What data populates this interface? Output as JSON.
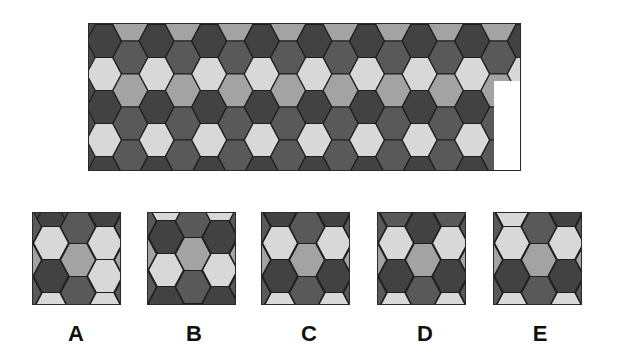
{
  "puzzle": {
    "question_mark": "?",
    "colors": {
      "dark": "#424242",
      "darkmed": "#595959",
      "medium": "#a3a3a3",
      "light": "#d8d8d8",
      "outline": "#1e1e1e",
      "background": "#4a4a4a"
    },
    "main_grid": {
      "hex_width": 35,
      "hex_height": 33,
      "col_pitch": 26.3,
      "even_col_x0": 15,
      "odd_col_x0": 41.3,
      "even_col_y": [
        17,
        50,
        83,
        116,
        149
      ],
      "odd_col_y": [
        0.5,
        33.5,
        66.5,
        99.5,
        132.5,
        165.5
      ],
      "even_col_pattern": [
        "dark",
        "light",
        "dark",
        "light",
        "dark"
      ],
      "odd_col_pattern": [
        "medium",
        "darkmed",
        "medium",
        "darkmed",
        "darkmed",
        "darkmed"
      ],
      "num_columns": 17
    },
    "options": [
      {
        "label": "A",
        "box_x": 32,
        "label_x": 56,
        "columns": [
          {
            "x": 18,
            "cells": [
              {
                "y": 13,
                "c": "dark"
              },
              {
                "y": 30,
                "c": "light"
              },
              {
                "y": 63,
                "c": "dark"
              },
              {
                "y": 96,
                "c": "light"
              }
            ]
          },
          {
            "x": 45,
            "cells": [
              {
                "y": 14,
                "c": "darkmed"
              },
              {
                "y": 47,
                "c": "medium"
              },
              {
                "y": 80,
                "c": "darkmed"
              }
            ]
          },
          {
            "x": 72,
            "cells": [
              {
                "y": -3,
                "c": "dark"
              },
              {
                "y": 30,
                "c": "light"
              },
              {
                "y": 63,
                "c": "light"
              },
              {
                "y": 96,
                "c": "light"
              }
            ]
          },
          {
            "x": -9,
            "cells": [
              {
                "y": 14,
                "c": "darkmed"
              },
              {
                "y": 47,
                "c": "medium"
              },
              {
                "y": 80,
                "c": "darkmed"
              }
            ]
          },
          {
            "x": 99,
            "cells": [
              {
                "y": 14,
                "c": "darkmed"
              },
              {
                "y": 47,
                "c": "medium"
              },
              {
                "y": 80,
                "c": "darkmed"
              }
            ]
          }
        ]
      },
      {
        "label": "B",
        "box_x": 147,
        "label_x": 174,
        "columns": [
          {
            "x": 18,
            "cells": [
              {
                "y": -7,
                "c": "light"
              },
              {
                "y": 24,
                "c": "dark"
              },
              {
                "y": 57,
                "c": "light"
              },
              {
                "y": 90,
                "c": "dark"
              }
            ]
          },
          {
            "x": 45,
            "cells": [
              {
                "y": 8,
                "c": "darkmed"
              },
              {
                "y": 41,
                "c": "medium"
              },
              {
                "y": 74,
                "c": "darkmed"
              }
            ]
          },
          {
            "x": 72,
            "cells": [
              {
                "y": -7,
                "c": "light"
              },
              {
                "y": 24,
                "c": "dark"
              },
              {
                "y": 57,
                "c": "light"
              },
              {
                "y": 90,
                "c": "dark"
              }
            ]
          },
          {
            "x": -9,
            "cells": [
              {
                "y": 8,
                "c": "darkmed"
              },
              {
                "y": 41,
                "c": "medium"
              },
              {
                "y": 74,
                "c": "darkmed"
              }
            ]
          },
          {
            "x": 99,
            "cells": [
              {
                "y": 8,
                "c": "darkmed"
              },
              {
                "y": 41,
                "c": "medium"
              },
              {
                "y": 74,
                "c": "darkmed"
              }
            ]
          }
        ]
      },
      {
        "label": "C",
        "box_x": 261,
        "label_x": 289,
        "columns": [
          {
            "x": 18,
            "cells": [
              {
                "y": -3,
                "c": "dark"
              },
              {
                "y": 30,
                "c": "light"
              },
              {
                "y": 63,
                "c": "dark"
              },
              {
                "y": 96,
                "c": "light"
              }
            ]
          },
          {
            "x": 45,
            "cells": [
              {
                "y": 14,
                "c": "darkmed"
              },
              {
                "y": 47,
                "c": "medium"
              },
              {
                "y": 80,
                "c": "darkmed"
              }
            ]
          },
          {
            "x": 72,
            "cells": [
              {
                "y": -3,
                "c": "dark"
              },
              {
                "y": 30,
                "c": "light"
              },
              {
                "y": 63,
                "c": "dark"
              },
              {
                "y": 96,
                "c": "light"
              }
            ]
          },
          {
            "x": -9,
            "cells": [
              {
                "y": 14,
                "c": "darkmed"
              },
              {
                "y": 47,
                "c": "medium"
              },
              {
                "y": 80,
                "c": "darkmed"
              }
            ]
          },
          {
            "x": 99,
            "cells": [
              {
                "y": 14,
                "c": "darkmed"
              },
              {
                "y": 47,
                "c": "medium"
              },
              {
                "y": 80,
                "c": "darkmed"
              }
            ]
          }
        ]
      },
      {
        "label": "D",
        "box_x": 377,
        "label_x": 405,
        "columns": [
          {
            "x": 18,
            "cells": [
              {
                "y": -3,
                "c": "darkmed"
              },
              {
                "y": 30,
                "c": "light"
              },
              {
                "y": 63,
                "c": "dark"
              },
              {
                "y": 96,
                "c": "light"
              }
            ]
          },
          {
            "x": 45,
            "cells": [
              {
                "y": 14,
                "c": "dark"
              },
              {
                "y": 47,
                "c": "medium"
              },
              {
                "y": 80,
                "c": "darkmed"
              }
            ]
          },
          {
            "x": 72,
            "cells": [
              {
                "y": -3,
                "c": "darkmed"
              },
              {
                "y": 30,
                "c": "light"
              },
              {
                "y": 63,
                "c": "dark"
              },
              {
                "y": 96,
                "c": "light"
              }
            ]
          },
          {
            "x": -9,
            "cells": [
              {
                "y": 14,
                "c": "darkmed"
              },
              {
                "y": 47,
                "c": "medium"
              },
              {
                "y": 80,
                "c": "darkmed"
              }
            ]
          },
          {
            "x": 99,
            "cells": [
              {
                "y": 14,
                "c": "darkmed"
              },
              {
                "y": 47,
                "c": "medium"
              },
              {
                "y": 80,
                "c": "darkmed"
              }
            ]
          }
        ]
      },
      {
        "label": "E",
        "box_x": 493,
        "label_x": 520,
        "columns": [
          {
            "x": 18,
            "cells": [
              {
                "y": -3,
                "c": "light"
              },
              {
                "y": 30,
                "c": "light"
              },
              {
                "y": 63,
                "c": "dark"
              },
              {
                "y": 96,
                "c": "light"
              }
            ]
          },
          {
            "x": 45,
            "cells": [
              {
                "y": 14,
                "c": "darkmed"
              },
              {
                "y": 47,
                "c": "medium"
              },
              {
                "y": 80,
                "c": "darkmed"
              }
            ]
          },
          {
            "x": 72,
            "cells": [
              {
                "y": -3,
                "c": "dark"
              },
              {
                "y": 30,
                "c": "light"
              },
              {
                "y": 63,
                "c": "dark"
              },
              {
                "y": 96,
                "c": "light"
              }
            ]
          },
          {
            "x": -9,
            "cells": [
              {
                "y": 14,
                "c": "darkmed"
              },
              {
                "y": 47,
                "c": "medium"
              },
              {
                "y": 80,
                "c": "darkmed"
              }
            ]
          },
          {
            "x": 99,
            "cells": [
              {
                "y": 14,
                "c": "darkmed"
              },
              {
                "y": 47,
                "c": "medium"
              },
              {
                "y": 80,
                "c": "darkmed"
              }
            ]
          }
        ]
      }
    ]
  }
}
